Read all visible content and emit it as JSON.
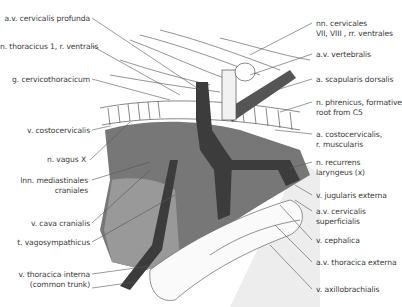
{
  "figure": {
    "type": "anatomical illustration"
  },
  "labels_left": [
    {
      "id": "cervicalis-profunda",
      "text": "a.v. cervicalis profunda",
      "x": 4,
      "y": 14,
      "w": 86
    },
    {
      "id": "thoracicus-1",
      "text": "n. thoracicus 1, r. ventralis",
      "x": 0,
      "y": 42,
      "w": 90
    },
    {
      "id": "cervicothoracicum",
      "text": "g. cervicothoracicum",
      "x": 4,
      "y": 75,
      "w": 86
    },
    {
      "id": "costocervicalis-v",
      "text": "v. costocervicalis",
      "x": 4,
      "y": 126,
      "w": 86
    },
    {
      "id": "vagus",
      "text": "n. vagus X",
      "x": 4,
      "y": 155,
      "w": 82
    },
    {
      "id": "mediastinales",
      "text": "lnn. mediastinales",
      "text2": "craniales",
      "x": 4,
      "y": 176,
      "w": 84
    },
    {
      "id": "cava",
      "text": "v. cava cranialis",
      "x": 4,
      "y": 219,
      "w": 86
    },
    {
      "id": "vagosympathicus",
      "text": "t. vagosympathicus",
      "x": 4,
      "y": 238,
      "w": 86
    },
    {
      "id": "thoracica-interna",
      "text": "v. thoracica interna",
      "text2": "(common trunk)",
      "x": 4,
      "y": 270,
      "w": 86
    }
  ],
  "labels_right": [
    {
      "id": "cervicales",
      "text": "nn. cervicales",
      "text2": "VII, VIII , rr. ventrales",
      "x": 316,
      "y": 19
    },
    {
      "id": "vertebralis",
      "text": "a.v. vertebralis",
      "x": 316,
      "y": 50
    },
    {
      "id": "scapularis",
      "text": "a. scapularis dorsalis",
      "x": 316,
      "y": 75
    },
    {
      "id": "phrenicus",
      "text": "n. phrenicus, formative",
      "text2": "root from C5",
      "x": 316,
      "y": 98
    },
    {
      "id": "costocervicalis-a",
      "text": "a. costocervicalis,",
      "text2": "r. muscularis",
      "x": 316,
      "y": 130
    },
    {
      "id": "recurrens",
      "text": "n. recurrens",
      "text2": "laryngeus (x)",
      "x": 316,
      "y": 158
    },
    {
      "id": "jugularis",
      "text": "v. jugularis externa",
      "x": 316,
      "y": 191
    },
    {
      "id": "cervicalis-superf",
      "text": "a.v. cervicalis",
      "text2": "superficialis",
      "x": 316,
      "y": 207
    },
    {
      "id": "cephalica",
      "text": "v. cephalica",
      "x": 316,
      "y": 236
    },
    {
      "id": "thoracica-externa",
      "text": "a.v. thoracica externa",
      "x": 316,
      "y": 258
    },
    {
      "id": "axillobrachialis",
      "text": "v. axillobrachialis",
      "x": 316,
      "y": 285
    }
  ],
  "colors": {
    "line": "#555555",
    "dark_vessel": "#3c3c3c",
    "mid_tissue": "#6f6f6f",
    "light_tissue": "#9a9a9a",
    "pale": "#e6e6e6",
    "text": "#3a3a3a"
  }
}
